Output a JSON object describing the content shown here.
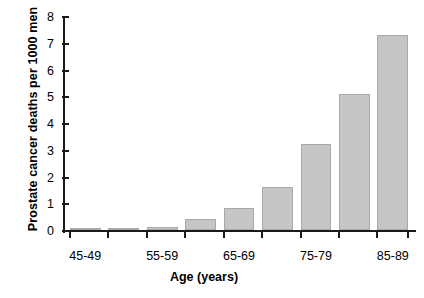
{
  "chart_data": {
    "type": "bar",
    "title": "",
    "subtitle": "",
    "xlabel": "Age (years)",
    "ylabel": "Prostate cancer deaths per 1000 men",
    "categories": [
      "45-49",
      "50-54",
      "55-59",
      "60-64",
      "65-69",
      "70-74",
      "75-79",
      "80-84",
      "85-89"
    ],
    "values": [
      0.02,
      0.07,
      0.12,
      0.42,
      0.82,
      1.62,
      3.2,
      5.1,
      7.3
    ],
    "ylim": [
      0,
      8
    ],
    "ytick_labels": [
      "0",
      "1",
      "2",
      "3",
      "4",
      "5",
      "6",
      "7",
      "8"
    ],
    "ytick_values": [
      0,
      1,
      2,
      3,
      4,
      5,
      6,
      7,
      8
    ],
    "visible_xtick_labels": [
      "45-49",
      "55-59",
      "65-69",
      "75-79",
      "85-89"
    ],
    "visible_xtick_indices": [
      0,
      2,
      4,
      6,
      8
    ],
    "grid": false,
    "legend": null,
    "legend_position": "none",
    "bar_fill_color": "#c6c6c6",
    "bar_edge_color": "#a9a9a9",
    "axis_color": "#1a1a1a",
    "background_color": "#ffffff"
  }
}
